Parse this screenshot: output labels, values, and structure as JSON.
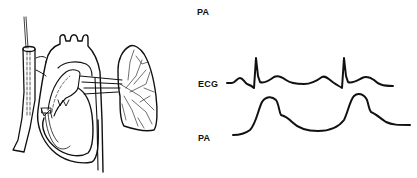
{
  "figure": {
    "labels": {
      "top_pa": "PA",
      "ecg": "ECG",
      "bottom_pa": "PA"
    },
    "colors": {
      "ink": "#111111",
      "background": "#ffffff"
    }
  }
}
